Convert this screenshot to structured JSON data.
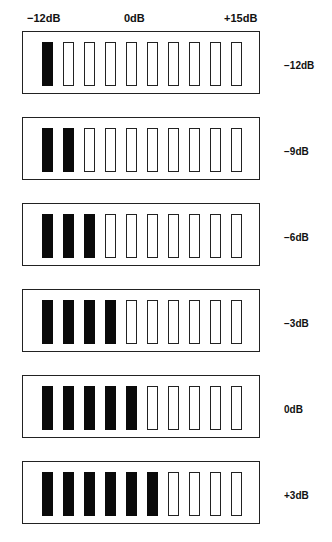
{
  "scale": {
    "left": "−12dB",
    "center": "0dB",
    "right": "+15dB"
  },
  "colors": {
    "lit": "#0a0a0a",
    "unlit": "#ffffff",
    "outline": "#222222"
  },
  "segments_per_meter": 10,
  "meters": [
    {
      "level_label": "−12dB",
      "lit_segments": 1
    },
    {
      "level_label": "−9dB",
      "lit_segments": 2
    },
    {
      "level_label": "−6dB",
      "lit_segments": 3
    },
    {
      "level_label": "−3dB",
      "lit_segments": 4
    },
    {
      "level_label": "0dB",
      "lit_segments": 5
    },
    {
      "level_label": "+3dB",
      "lit_segments": 6
    }
  ]
}
